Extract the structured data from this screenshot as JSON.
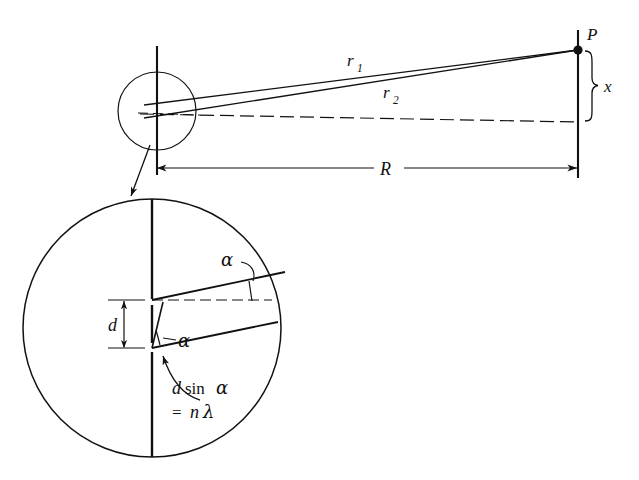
{
  "figure": {
    "background_color": "#ffffff",
    "ink_color": "#111111",
    "labels": {
      "point_p": "P",
      "ray_1": "r",
      "ray_1_sub": "1",
      "ray_2": "r",
      "ray_2_sub": "2",
      "screen_offset": "x",
      "distance_r": "R",
      "slit_separation": "d",
      "angle_upper": "α",
      "angle_lower": "α",
      "path_difference_line1_part1": "d",
      "path_difference_line1_part2": "sin",
      "path_difference_line1_part3": "α",
      "path_difference_line2_part1": "=",
      "path_difference_line2_part2": "n",
      "path_difference_line2_part3": "λ"
    },
    "geometry": {
      "top_circle": {
        "cx": 157,
        "cy": 111,
        "r": 39
      },
      "magnified_circle": {
        "cx": 152,
        "cy": 328,
        "r": 129
      },
      "slit_plane_x": 157,
      "screen_plane_x": 578,
      "point_p": {
        "x": 578,
        "y": 50
      },
      "axis_y": 115,
      "dimension_r_y": 168,
      "slit_top_y": 300,
      "slit_bottom_y": 348,
      "alpha_degrees": 12
    },
    "elements": [
      {
        "name": "slit-plane-line",
        "kind": "line"
      },
      {
        "name": "screen-plane-line",
        "kind": "line"
      },
      {
        "name": "ray-r1",
        "kind": "line"
      },
      {
        "name": "ray-r2",
        "kind": "line"
      },
      {
        "name": "optical-axis",
        "kind": "dashed-line"
      },
      {
        "name": "point-p-marker",
        "kind": "dot"
      },
      {
        "name": "x-brace",
        "kind": "brace"
      },
      {
        "name": "r-dimension",
        "kind": "double-arrow"
      },
      {
        "name": "magnifier-pointer",
        "kind": "arrow"
      },
      {
        "name": "d-dimension",
        "kind": "double-arrow"
      },
      {
        "name": "wavefront-upper",
        "kind": "line"
      },
      {
        "name": "wavefront-lower",
        "kind": "line"
      },
      {
        "name": "path-difference-segment",
        "kind": "line"
      },
      {
        "name": "reference-dashed",
        "kind": "dashed-line"
      },
      {
        "name": "alpha-arc-upper",
        "kind": "arc"
      },
      {
        "name": "alpha-arc-lower",
        "kind": "arc"
      },
      {
        "name": "path-difference-callout",
        "kind": "curved-arrow"
      }
    ]
  }
}
